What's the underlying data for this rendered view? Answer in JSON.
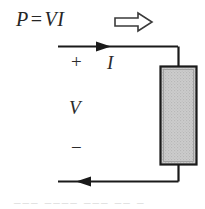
{
  "figure": {
    "equation": {
      "p": "P",
      "equals": "=",
      "vi": "VI"
    },
    "power_flow_arrow": "block-arrow-right",
    "labels": {
      "plus": "+",
      "current": "I",
      "voltage": "V",
      "minus": "−"
    },
    "element": {
      "name": "resistive element",
      "fill": "#cccccc",
      "stroke": "#1a1a1a",
      "pattern": "dotted-hatch"
    },
    "wire": {
      "color": "#1a1a1a",
      "top_current_direction": "right",
      "bottom_current_direction": "left"
    },
    "colors": {
      "ink": "#262626",
      "background": "#ffffff",
      "element_fill": "#cccccc",
      "arrow_outline": "#333333"
    },
    "caption_fragment": "___  ____ ___ __ _"
  }
}
